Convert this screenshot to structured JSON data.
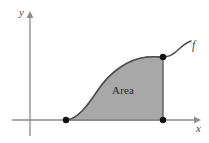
{
  "figure": {
    "background_color": "#ffffff",
    "labels": {
      "y_axis": "y",
      "x_axis": "x",
      "curve": "f",
      "region": "Area"
    },
    "colors": {
      "axis": "#8c8c8c",
      "curve": "#4d4d4d",
      "fill": "#a8a8a8",
      "fill_border": "#6e6e6e",
      "point": "#111111",
      "text": "#3a3a3a"
    },
    "axes": {
      "x_axis": {
        "y": 120,
        "x_start": 12,
        "x_end": 196,
        "arrow": true
      },
      "y_axis": {
        "x": 30,
        "y_start": 14,
        "y_end": 136,
        "arrow": true
      }
    },
    "points": [
      {
        "name": "left-endpoint",
        "x": 66,
        "y": 120
      },
      {
        "name": "right-endpoint-top",
        "x": 163,
        "y": 57
      },
      {
        "name": "right-endpoint-bottom",
        "x": 163,
        "y": 120
      }
    ],
    "curve": {
      "path": "M 66,120 C 78,119 88,105 98,90 C 110,72 128,59 147,57 C 153,56.5 158,56.8 163,57",
      "extension_path": "M 163,57 C 170,57 174,54 178,50 C 182,46 186,43 191,41",
      "stroke_width": 1.6
    },
    "region": {
      "path": "M 66,120 C 78,119 88,105 98,90 C 110,72 128,59 147,57 C 153,56.5 158,56.8 163,57 L 163,120 Z"
    },
    "point_radius": 3.2
  }
}
